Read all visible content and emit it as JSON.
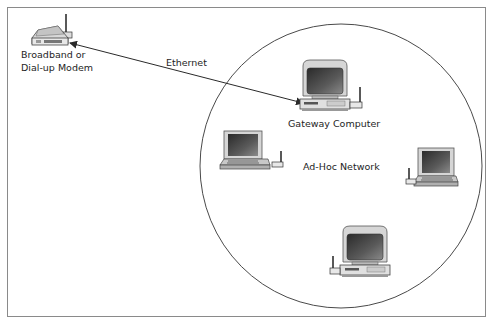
{
  "diagram": {
    "type": "network-topology",
    "nodes": [
      {
        "id": "modem",
        "icon": "modem-icon",
        "label_lines": [
          "Broadband or",
          "Dial-up Modem"
        ]
      },
      {
        "id": "gateway",
        "icon": "desktop-computer-icon",
        "label": "Gateway Computer"
      },
      {
        "id": "laptop-left",
        "icon": "laptop-icon",
        "label": ""
      },
      {
        "id": "laptop-right",
        "icon": "laptop-icon",
        "label": ""
      },
      {
        "id": "desktop-bottom",
        "icon": "desktop-computer-icon",
        "label": ""
      }
    ],
    "edges": [
      {
        "from": "modem",
        "to": "gateway",
        "label": "Ethernet",
        "style": "double-arrow"
      }
    ],
    "groups": [
      {
        "id": "adhoc",
        "shape": "ellipse",
        "label": "Ad-Hoc Network",
        "members": [
          "gateway",
          "laptop-left",
          "laptop-right",
          "desktop-bottom"
        ]
      }
    ]
  },
  "labels": {
    "modem_line1": "Broadband or",
    "modem_line2": "Dial-up Modem",
    "ethernet": "Ethernet",
    "gateway": "Gateway Computer",
    "adhoc": "Ad-Hoc Network"
  },
  "colors": {
    "line": "#3a3a3a",
    "frame": "#8a8a8a",
    "device_body": "#e2e2e2",
    "device_shadow": "#9a9a9a",
    "screen": "#3c3c3c"
  }
}
